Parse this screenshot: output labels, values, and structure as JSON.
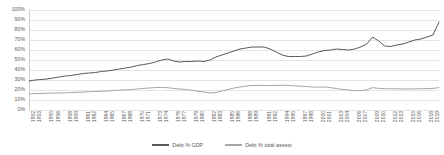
{
  "chart_data": {
    "type": "line",
    "title": "",
    "xlabel": "",
    "ylabel": "",
    "ylim": [
      0,
      100
    ],
    "ytick_labels": [
      "0%",
      "10%",
      "20%",
      "30%",
      "40%",
      "50%",
      "60%",
      "70%",
      "80%",
      "90%",
      "100%"
    ],
    "ytick_values": [
      0,
      10,
      20,
      30,
      40,
      50,
      60,
      70,
      80,
      90,
      100
    ],
    "grid": true,
    "legend_position": "bottom",
    "x_start": 1952,
    "x_end": 2020,
    "xtick_labels": [
      "1952",
      "1953",
      "1955",
      "1956",
      "1958",
      "1959",
      "1961",
      "1962",
      "1964",
      "1965",
      "1967",
      "1968",
      "1970",
      "1971",
      "1973",
      "1974",
      "1976",
      "1977",
      "1979",
      "1980",
      "1982",
      "1983",
      "1985",
      "1986",
      "1988",
      "1989",
      "1991",
      "1992",
      "1994",
      "1995",
      "1997",
      "1998",
      "2000",
      "2001",
      "2003",
      "2004",
      "2006",
      "2007",
      "2009",
      "2010",
      "2012",
      "2013",
      "2015",
      "2016",
      "2018",
      "2019"
    ],
    "x": [
      1952,
      1953,
      1954,
      1955,
      1956,
      1957,
      1958,
      1959,
      1960,
      1961,
      1962,
      1963,
      1964,
      1965,
      1966,
      1967,
      1968,
      1969,
      1970,
      1971,
      1972,
      1973,
      1974,
      1975,
      1976,
      1977,
      1978,
      1979,
      1980,
      1981,
      1982,
      1983,
      1984,
      1985,
      1986,
      1987,
      1988,
      1989,
      1990,
      1991,
      1992,
      1993,
      1994,
      1995,
      1996,
      1997,
      1998,
      1999,
      2000,
      2001,
      2002,
      2003,
      2004,
      2005,
      2006,
      2007,
      2008,
      2009,
      2010,
      2011,
      2012,
      2013,
      2014,
      2015,
      2016,
      2017,
      2018,
      2019,
      2020
    ],
    "series": [
      {
        "name": "Debt % GDP",
        "color": "#595959",
        "values": [
          29,
          30,
          30.5,
          31,
          32,
          33,
          34,
          34.5,
          35.5,
          36.5,
          37,
          37.5,
          38.5,
          39,
          40,
          41,
          42,
          43,
          44.5,
          45.5,
          46.5,
          48,
          50,
          51,
          49,
          48,
          48.5,
          48.5,
          49,
          48.5,
          50,
          53,
          55,
          57,
          59,
          61,
          62,
          63,
          63,
          63,
          61,
          58,
          55,
          53.5,
          53.5,
          53.5,
          54,
          56,
          58,
          59.5,
          60,
          61,
          60.5,
          60,
          61,
          63,
          66,
          73,
          69,
          64,
          63.5,
          65,
          66,
          68,
          70,
          71,
          73,
          75,
          88
        ]
      },
      {
        "name": "Debt % total assets",
        "color": "#a6a6a6",
        "values": [
          16,
          16.5,
          16.5,
          16.8,
          17,
          17,
          17.2,
          17.5,
          17.6,
          18,
          18.2,
          18.5,
          18.8,
          19,
          19.4,
          19.8,
          20.2,
          20.5,
          21,
          21.6,
          22,
          22.5,
          22.5,
          22.3,
          21.5,
          21,
          20.5,
          19.8,
          18.8,
          18,
          17,
          17.5,
          19,
          20.5,
          22,
          23,
          24,
          24.5,
          24.6,
          24.4,
          24.5,
          24.6,
          24.8,
          24.6,
          24.2,
          23.8,
          23.5,
          23,
          22.8,
          23,
          22.4,
          21.4,
          20.6,
          20,
          19.4,
          19.3,
          20.2,
          22.4,
          21.6,
          21.4,
          21.2,
          21.2,
          21.1,
          21,
          21.2,
          21.2,
          21.4,
          21.6,
          22.4
        ]
      }
    ]
  },
  "legend": {
    "items": [
      {
        "label": "Debt % GDP",
        "color": "#595959"
      },
      {
        "label": "Debt % total assets",
        "color": "#a6a6a6"
      }
    ]
  }
}
